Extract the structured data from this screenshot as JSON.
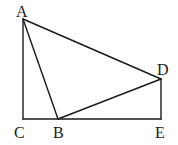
{
  "diagram": {
    "points": [
      {
        "name": "A",
        "label": "A"
      },
      {
        "name": "B",
        "label": "B"
      },
      {
        "name": "C",
        "label": "C"
      },
      {
        "name": "D",
        "label": "D"
      },
      {
        "name": "E",
        "label": "E"
      }
    ],
    "segments": [
      [
        "A",
        "C"
      ],
      [
        "C",
        "B"
      ],
      [
        "B",
        "E"
      ],
      [
        "E",
        "D"
      ],
      [
        "A",
        "B"
      ],
      [
        "A",
        "D"
      ],
      [
        "B",
        "D"
      ]
    ],
    "color": "#1a1a1a"
  }
}
